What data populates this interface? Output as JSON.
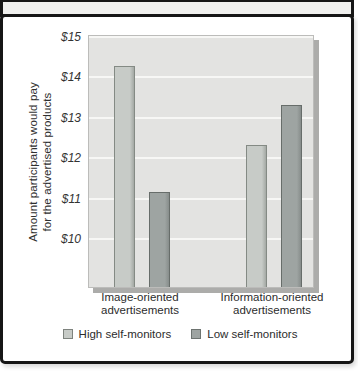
{
  "chart_data": {
    "type": "bar",
    "title": "",
    "ylabel": "Amount participants would pay for the advertised products",
    "ylabel_lines": [
      "Amount participants would pay",
      "for the advertised products"
    ],
    "categories": [
      "Image-oriented advertisements",
      "Information-oriented advertisements"
    ],
    "category_lines": [
      [
        "Image-oriented",
        "advertisements"
      ],
      [
        "Information-oriented",
        "advertisements"
      ]
    ],
    "series": [
      {
        "name": "High self-monitors",
        "values": [
          14.2,
          12.25
        ],
        "fill": "#c7cbc7",
        "edge": "#848a84",
        "shade": "#a4a9a4"
      },
      {
        "name": "Low self-monitors",
        "values": [
          11.1,
          13.25
        ],
        "fill": "#9ea4a2",
        "edge": "#676d6a",
        "shade": "#878d8b"
      }
    ],
    "yticks": [
      "$15",
      "$14",
      "$13",
      "$12",
      "$11",
      "$10"
    ],
    "ytick_values": [
      15,
      14,
      13,
      12,
      11,
      10
    ],
    "ylim": [
      8.75,
      15
    ],
    "grid": {
      "horizontal": true,
      "color": "#f7f7f5",
      "interval": 1
    },
    "legend_position": "bottom",
    "colors": {
      "plot_bg": "#e3e3e1",
      "plot_shadow": "#acacaa",
      "box_border": "#161616",
      "strip_bg": "#f0f0ee",
      "text": "#2c2c2c"
    }
  }
}
